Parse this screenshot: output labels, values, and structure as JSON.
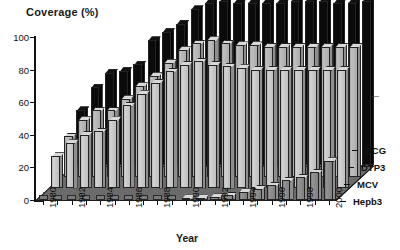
{
  "chart_data": {
    "type": "bar",
    "subtype": "3d-grouped-bar",
    "title": "",
    "ylabel": "Coverage (%)",
    "xlabel": "Year",
    "ylim": [
      0,
      100
    ],
    "yticks": [
      0,
      20,
      40,
      60,
      80,
      100
    ],
    "grid": false,
    "legend_position": "right",
    "categories": [
      "1980",
      "1981",
      "1982",
      "1983",
      "1984",
      "1985",
      "1986",
      "1987",
      "1988",
      "1989",
      "1990",
      "1991",
      "1992",
      "1993",
      "1994",
      "1995",
      "1996",
      "1997",
      "1998",
      "1999",
      "2000"
    ],
    "xtick_labels": [
      "1980",
      "1982",
      "1984",
      "1986",
      "1988",
      "1990",
      "1992",
      "1994",
      "1996",
      "1998",
      "2000"
    ],
    "series": [
      {
        "name": "BCG",
        "color": "#0d0d0d",
        "values": [
          34,
          48,
          57,
          58,
          62,
          77,
          82,
          87,
          96,
          100,
          101,
          100,
          100,
          100,
          100,
          101,
          101,
          101,
          100,
          100,
          101
        ]
      },
      {
        "name": "DTP3",
        "color": "#b5b5b5",
        "values": [
          25,
          35,
          41,
          41,
          48,
          56,
          62,
          70,
          78,
          82,
          84,
          82,
          81,
          81,
          80,
          80,
          80,
          80,
          80,
          80,
          80
        ]
      },
      {
        "name": "MCV",
        "color": "#c8c8c8",
        "values": [
          20,
          28,
          33,
          35,
          42,
          51,
          58,
          65,
          72,
          76,
          78,
          76,
          75,
          74,
          73,
          73,
          73,
          73,
          73,
          73,
          73
        ]
      },
      {
        "name": "Hepb3",
        "color": "#8a8a8a",
        "values": [
          0,
          0,
          0,
          0,
          0,
          0,
          0,
          0,
          0,
          0,
          1,
          1,
          2,
          3,
          5,
          7,
          9,
          12,
          14,
          17,
          24
        ]
      }
    ]
  },
  "legend": {
    "items": [
      {
        "label": "BCG"
      },
      {
        "label": "DTP3"
      },
      {
        "label": "MCV"
      },
      {
        "label": "Hepb3"
      }
    ]
  }
}
